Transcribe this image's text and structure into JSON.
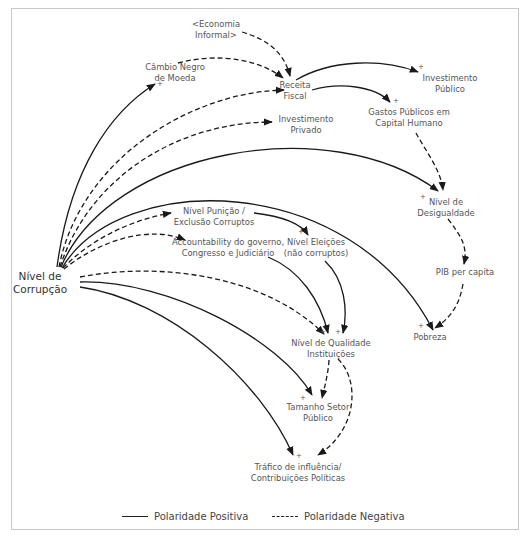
{
  "diagram": {
    "type": "causal-loop-diagram",
    "nodes": {
      "corrupcao": {
        "line1": "Nível de",
        "line2": "Corrupção"
      },
      "economia_informal": {
        "line1": "<Economia",
        "line2": "Informal>"
      },
      "cambio_negro": {
        "line1": "Câmbio Negro",
        "line2": "de Moeda"
      },
      "receita_fiscal": {
        "line1": "Receita",
        "line2": "Fiscal"
      },
      "investimento_publico": {
        "line1": "Investimento",
        "line2": "Público"
      },
      "investimento_privado": {
        "line1": "Investimento",
        "line2": "Privado"
      },
      "gastos_publicos": {
        "line1": "Gastos Públicos em",
        "line2": "Capital Humano"
      },
      "desigualdade": {
        "line1": "Nível de",
        "line2": "Desigualdade"
      },
      "pib": {
        "line1": "PIB per capita"
      },
      "pobreza": {
        "line1": "Pobreza"
      },
      "punicao": {
        "line1": "Nível Punição /",
        "line2": "Exclusão Corruptos"
      },
      "accountability": {
        "line1": "Accountability do governo,",
        "line2": "Congresso e Judiciário"
      },
      "eleicoes": {
        "line1": "Nível Eleições",
        "line2": "(não corruptos)"
      },
      "qualidade": {
        "line1": "Nível de Qualidade",
        "line2": "Instituições"
      },
      "tamanho_setor": {
        "line1": "Tamanho Setor",
        "line2": "Público"
      },
      "trafico": {
        "line1": "Tráfico de influência/",
        "line2": "Contribuições Políticas"
      }
    },
    "signs": {
      "plus": "+"
    },
    "edges": [
      {
        "from": "Nível de Corrupção",
        "to": "Câmbio Negro de Moeda",
        "polarity": "positive"
      },
      {
        "from": "Nível de Corrupção",
        "to": "Receita Fiscal",
        "polarity": "negative"
      },
      {
        "from": "Nível de Corrupção",
        "to": "Investimento Privado",
        "polarity": "negative"
      },
      {
        "from": "Nível de Corrupção",
        "to": "Nível de Desigualdade",
        "polarity": "positive"
      },
      {
        "from": "Nível de Corrupção",
        "to": "Pobreza",
        "polarity": "positive"
      },
      {
        "from": "Nível de Corrupção",
        "to": "Nível Punição / Exclusão Corruptos",
        "polarity": "negative"
      },
      {
        "from": "Nível de Corrupção",
        "to": "Accountability do governo, Congresso e Judiciário",
        "polarity": "negative"
      },
      {
        "from": "Nível de Corrupção",
        "to": "Nível de Qualidade Instituições",
        "polarity": "negative"
      },
      {
        "from": "Nível de Corrupção",
        "to": "Tamanho Setor Público",
        "polarity": "positive"
      },
      {
        "from": "Nível de Corrupção",
        "to": "Tráfico de influência/Contribuições Políticas",
        "polarity": "positive"
      },
      {
        "from": "<Economia Informal>",
        "to": "Receita Fiscal",
        "polarity": "negative"
      },
      {
        "from": "Câmbio Negro de Moeda",
        "to": "Receita Fiscal",
        "polarity": "negative"
      },
      {
        "from": "Receita Fiscal",
        "to": "Investimento Público",
        "polarity": "positive"
      },
      {
        "from": "Receita Fiscal",
        "to": "Gastos Públicos em Capital Humano",
        "polarity": "positive"
      },
      {
        "from": "Gastos Públicos em Capital Humano",
        "to": "Nível de Desigualdade",
        "polarity": "negative"
      },
      {
        "from": "Nível de Desigualdade",
        "to": "PIB per capita",
        "polarity": "negative"
      },
      {
        "from": "PIB per capita",
        "to": "Pobreza",
        "polarity": "negative"
      },
      {
        "from": "Nível Punição / Exclusão Corruptos",
        "to": "Nível Eleições (não corruptos)",
        "polarity": "positive"
      },
      {
        "from": "Accountability do governo, Congresso e Judiciário",
        "to": "Nível de Qualidade Instituições",
        "polarity": "positive"
      },
      {
        "from": "Nível Eleições (não corruptos)",
        "to": "Nível de Qualidade Instituições",
        "polarity": "positive"
      },
      {
        "from": "Nível de Qualidade Instituições",
        "to": "Tamanho Setor Público",
        "polarity": "negative"
      },
      {
        "from": "Nível de Qualidade Instituições",
        "to": "Tráfico de influência/Contribuições Políticas",
        "polarity": "negative"
      }
    ]
  },
  "legend": {
    "positive_label": "Polaridade Positiva",
    "negative_label": "Polaridade Negativa"
  },
  "colors": {
    "line": "#1a1a1a",
    "text": "#555555",
    "frame": "#c9c9c9"
  }
}
